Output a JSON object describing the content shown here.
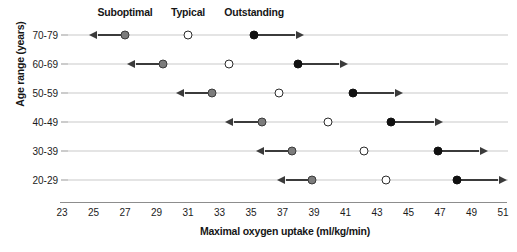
{
  "chart_data": {
    "type": "scatter",
    "title": "",
    "xlabel": "Maximal oxygen uptake (ml/kg/min)",
    "ylabel": "Age range (years)",
    "xlim": [
      23,
      51
    ],
    "xticks": [
      23,
      25,
      27,
      29,
      31,
      33,
      35,
      37,
      39,
      41,
      43,
      45,
      47,
      49,
      51
    ],
    "xtick_labels": [
      "23",
      "25",
      "27",
      "29",
      "31",
      "33",
      "35",
      "37",
      "39",
      "41",
      "43",
      "45",
      "47",
      "49",
      "51"
    ],
    "categories": [
      "70-79",
      "60-69",
      "50-59",
      "40-49",
      "30-39",
      "20-29"
    ],
    "grid": false,
    "legend_position": "top",
    "legend": [
      {
        "name": "Suboptimal",
        "marker": "gray-filled-circle",
        "arrow": "left",
        "color": "#7c7c7c",
        "x": 27.0
      },
      {
        "name": "Typical",
        "marker": "open-circle",
        "arrow": "none",
        "color": "#ffffff",
        "x": 31.0
      },
      {
        "name": "Outstanding",
        "marker": "black-filled-circle",
        "arrow": "right",
        "color": "#111111",
        "x": 35.2
      }
    ],
    "series": [
      {
        "name": "Suboptimal",
        "marker": "gray-filled-circle",
        "arrow": "left",
        "values": [
          27.0,
          29.4,
          32.5,
          35.7,
          37.6,
          38.9
        ],
        "arrow_ends": [
          25.3,
          27.7,
          30.8,
          33.9,
          35.9,
          37.2
        ]
      },
      {
        "name": "Typical",
        "marker": "open-circle",
        "arrow": "none",
        "values": [
          31.0,
          33.6,
          36.8,
          39.9,
          42.2,
          43.6
        ],
        "arrow_ends": [
          null,
          null,
          null,
          null,
          null,
          null
        ]
      },
      {
        "name": "Outstanding",
        "marker": "black-filled-circle",
        "arrow": "right",
        "values": [
          35.2,
          38.0,
          41.5,
          43.9,
          46.9,
          48.1
        ],
        "arrow_ends": [
          37.8,
          40.6,
          44.1,
          46.6,
          49.5,
          50.7
        ]
      }
    ]
  },
  "colors": {
    "suboptimal": "#7c7c7c",
    "typical": "#ffffff",
    "outstanding": "#111111",
    "axis": "#8d8d8d",
    "rowline": "#c9c9c9",
    "arrow": "#3b3b3b"
  }
}
